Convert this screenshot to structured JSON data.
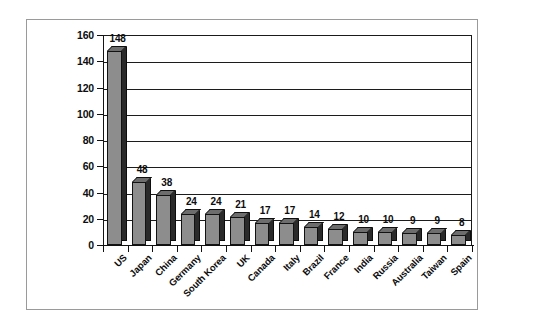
{
  "chart_data": {
    "type": "bar",
    "title": "",
    "subtitle": "",
    "xlabel": "",
    "ylabel": "",
    "ylim": [
      0,
      160
    ],
    "ytick_step": 20,
    "yticks": [
      0,
      20,
      40,
      60,
      80,
      100,
      120,
      140,
      160
    ],
    "grid": true,
    "grid_axis": "y",
    "legend": false,
    "legend_position": "none",
    "data_labels": true,
    "categories": [
      "US",
      "Japan",
      "China",
      "Germany",
      "South Korea",
      "UK",
      "Canada",
      "Italy",
      "Brazil",
      "France",
      "India",
      "Russia",
      "Australia",
      "Taiwan",
      "Spain"
    ],
    "values": [
      148,
      48,
      38,
      24,
      24,
      21,
      17,
      17,
      14,
      12,
      10,
      10,
      9,
      9,
      8
    ],
    "series": [
      {
        "name": "",
        "values": [
          148,
          48,
          38,
          24,
          24,
          21,
          17,
          17,
          14,
          12,
          10,
          10,
          9,
          9,
          8
        ]
      }
    ],
    "colors": {
      "bar_front": "#8d8d8d",
      "bar_side": "#2a2a2a",
      "bar_top": "#6d6d6d",
      "bar_outline": "#121212",
      "axis": "#101010",
      "gridline": "#1c1c1c",
      "text": "#0d0d0d",
      "plot_background": "#ffffff",
      "frame_border": "#9a9a9a"
    }
  }
}
